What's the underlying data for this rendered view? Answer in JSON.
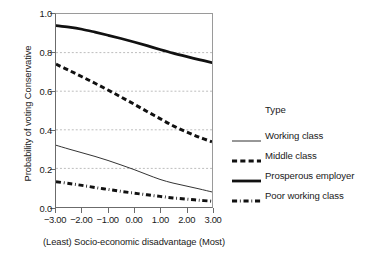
{
  "chart_data": {
    "type": "line",
    "title": "",
    "xlabel": "(Least) Socio-economic disadvantage (Most)",
    "ylabel": "Probability of voting Conservative",
    "xlim": [
      -3.0,
      3.0
    ],
    "ylim": [
      0.0,
      1.0
    ],
    "grid": "horizontal-dashed",
    "legend_position": "right",
    "legend_title": "Type",
    "x_ticks": [
      -3.0,
      -2.0,
      -1.0,
      0.0,
      1.0,
      2.0,
      3.0
    ],
    "x_tick_labels": [
      "-3.00",
      "-2.00",
      "-1.00",
      "0.00",
      "1.00",
      "2.00",
      "3.00"
    ],
    "y_ticks": [
      0.0,
      0.2,
      0.4,
      0.6,
      0.8,
      1.0
    ],
    "y_tick_labels": [
      "0.0",
      "0.2",
      "0.4",
      "0.6",
      "0.8",
      "1.0"
    ],
    "gridlines_y": [
      0.2,
      0.4,
      0.6,
      0.8
    ],
    "x": [
      -3.0,
      -2.5,
      -2.0,
      -1.5,
      -1.0,
      -0.5,
      0.0,
      0.5,
      1.0,
      1.5,
      2.0,
      2.5,
      3.0
    ],
    "series": [
      {
        "name": "Working class",
        "style": "solid",
        "width": 0.9,
        "color": "#1a1a1a",
        "values": [
          0.32,
          0.3,
          0.281,
          0.262,
          0.241,
          0.218,
          0.194,
          0.168,
          0.143,
          0.124,
          0.109,
          0.094,
          0.078
        ]
      },
      {
        "name": "Middle class",
        "style": "dashed",
        "width": 3.0,
        "color": "#111111",
        "values": [
          0.74,
          0.708,
          0.675,
          0.641,
          0.606,
          0.57,
          0.533,
          0.495,
          0.458,
          0.421,
          0.39,
          0.362,
          0.338
        ]
      },
      {
        "name": "Prosperous employer",
        "style": "solid",
        "width": 2.8,
        "color": "#111111",
        "values": [
          0.94,
          0.932,
          0.921,
          0.906,
          0.89,
          0.873,
          0.855,
          0.836,
          0.816,
          0.797,
          0.78,
          0.764,
          0.748
        ]
      },
      {
        "name": "Poor working class",
        "style": "dashdot",
        "width": 3.0,
        "color": "#111111",
        "values": [
          0.131,
          0.122,
          0.112,
          0.101,
          0.091,
          0.081,
          0.072,
          0.063,
          0.055,
          0.047,
          0.041,
          0.035,
          0.03
        ]
      }
    ]
  },
  "axis": {
    "y_title": "Probability of voting Conservative",
    "x_title": "(Least) Socio-economic disadvantage (Most)"
  },
  "legend": {
    "title": "Type",
    "entries": [
      {
        "label": "Working class"
      },
      {
        "label": "Middle class"
      },
      {
        "label": "Prosperous employer"
      },
      {
        "label": "Poor working class"
      }
    ]
  },
  "colors": {
    "line": "#111111",
    "axis": "#6b6b6b",
    "grid": "#9f9f9f",
    "background": "#ffffff"
  }
}
